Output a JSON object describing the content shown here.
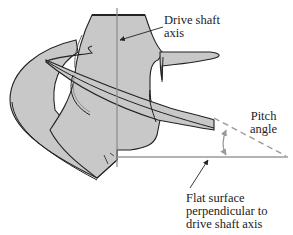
{
  "diagram": {
    "labels": {
      "drive_shaft": {
        "line1": "Drive shaft",
        "line2": "axis"
      },
      "pitch_angle": {
        "line1": "Pitch",
        "line2": "angle"
      },
      "flat_surface": {
        "line1": "Flat surface",
        "line2": "perpendicular to",
        "line3": "drive shaft axis"
      }
    },
    "colors": {
      "body_fill": "#c8c8c8",
      "outline": "#222222",
      "axis_line": "#8a8a8a",
      "reference_line": "#9a9a9a",
      "text": "#222222"
    }
  }
}
